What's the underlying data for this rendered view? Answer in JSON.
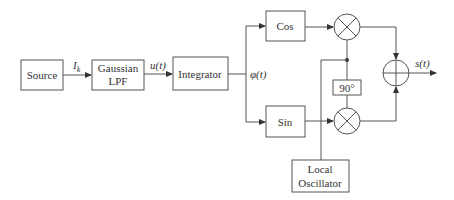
{
  "blocks": {
    "source": {
      "label": "Source"
    },
    "lpf": {
      "line1": "Gaussian",
      "line2": "LPF"
    },
    "integrator": {
      "label": "Integrator"
    },
    "cos": {
      "label": "Cos"
    },
    "sin": {
      "label": "Sin"
    },
    "phase_shift": {
      "label": "90°"
    },
    "local_oscillator": {
      "line1": "Local",
      "line2": "Oscillator"
    }
  },
  "signals": {
    "ik": {
      "main": "I",
      "sub": "k"
    },
    "ut": "u(t)",
    "phit": "φ(t)",
    "st": "s(t)"
  },
  "operators": {
    "mixer_top": "multiplier",
    "mixer_bottom": "multiplier",
    "summer": "adder"
  },
  "colors": {
    "stroke": "#555555",
    "text": "#333333",
    "background": "#ffffff"
  }
}
